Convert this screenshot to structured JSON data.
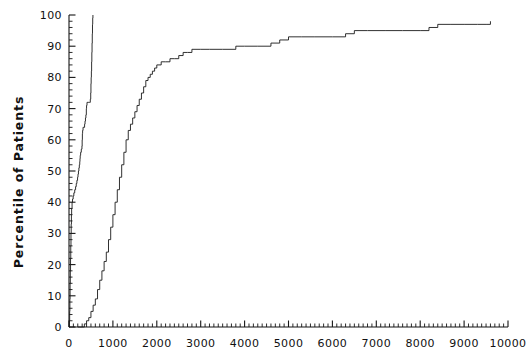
{
  "chart_data": {
    "type": "line",
    "title": "",
    "subtitle": "",
    "xlabel": "",
    "ylabel": "Percentile of Patients",
    "xlim": [
      0,
      10000
    ],
    "ylim": [
      0,
      100
    ],
    "grid": false,
    "legend": false,
    "legend_position": "none",
    "x_ticks": [
      0,
      1000,
      2000,
      3000,
      4000,
      5000,
      6000,
      7000,
      8000,
      9000,
      10000
    ],
    "x_tick_labels": [
      "0",
      "1000",
      "2000",
      "3000",
      "4000",
      "5000",
      "6000",
      "7000",
      "8000",
      "9000",
      "10000"
    ],
    "x_minor_tick_interval": 100,
    "y_ticks": [
      0,
      10,
      20,
      30,
      40,
      50,
      60,
      70,
      80,
      90,
      100
    ],
    "y_tick_labels": [
      "0",
      "10",
      "20",
      "30",
      "40",
      "50",
      "60",
      "70",
      "80",
      "90",
      "100"
    ],
    "y_minor_tick_interval": 2,
    "line_color": "#1a1a1a",
    "line_width": 0.9,
    "series": [
      {
        "name": "steep-cumulative-curve",
        "style": "step",
        "points": [
          [
            0,
            0
          ],
          [
            10,
            2
          ],
          [
            15,
            5
          ],
          [
            20,
            9
          ],
          [
            25,
            14
          ],
          [
            30,
            18
          ],
          [
            35,
            22
          ],
          [
            40,
            26
          ],
          [
            45,
            30
          ],
          [
            50,
            33
          ],
          [
            55,
            36
          ],
          [
            60,
            38
          ],
          [
            70,
            40
          ],
          [
            80,
            41
          ],
          [
            95,
            42
          ],
          [
            110,
            43
          ],
          [
            130,
            44
          ],
          [
            150,
            45
          ],
          [
            165,
            46
          ],
          [
            180,
            47
          ],
          [
            195,
            48
          ],
          [
            205,
            49
          ],
          [
            215,
            50
          ],
          [
            225,
            51
          ],
          [
            235,
            52
          ],
          [
            245,
            53
          ],
          [
            250,
            54
          ],
          [
            255,
            55
          ],
          [
            265,
            56
          ],
          [
            280,
            57
          ],
          [
            295,
            58
          ],
          [
            300,
            60
          ],
          [
            305,
            62
          ],
          [
            310,
            63
          ],
          [
            320,
            64
          ],
          [
            340,
            64
          ],
          [
            355,
            65
          ],
          [
            365,
            66
          ],
          [
            375,
            67
          ],
          [
            385,
            68
          ],
          [
            395,
            70
          ],
          [
            400,
            71
          ],
          [
            410,
            72
          ],
          [
            430,
            72
          ],
          [
            450,
            72
          ],
          [
            470,
            72
          ],
          [
            485,
            73
          ],
          [
            495,
            75
          ],
          [
            500,
            78
          ],
          [
            505,
            80
          ],
          [
            510,
            82
          ],
          [
            515,
            85
          ],
          [
            520,
            88
          ],
          [
            525,
            91
          ],
          [
            530,
            94
          ],
          [
            535,
            97
          ],
          [
            540,
            99
          ],
          [
            545,
            100
          ]
        ]
      },
      {
        "name": "broad-cumulative-curve",
        "style": "step",
        "points": [
          [
            200,
            0
          ],
          [
            300,
            0
          ],
          [
            350,
            1
          ],
          [
            400,
            2
          ],
          [
            450,
            3
          ],
          [
            500,
            5
          ],
          [
            550,
            7
          ],
          [
            600,
            9
          ],
          [
            650,
            12
          ],
          [
            700,
            15
          ],
          [
            750,
            18
          ],
          [
            800,
            21
          ],
          [
            850,
            24
          ],
          [
            900,
            28
          ],
          [
            950,
            32
          ],
          [
            1000,
            36
          ],
          [
            1050,
            40
          ],
          [
            1100,
            44
          ],
          [
            1150,
            48
          ],
          [
            1200,
            52
          ],
          [
            1250,
            56
          ],
          [
            1300,
            60
          ],
          [
            1350,
            63
          ],
          [
            1400,
            65
          ],
          [
            1450,
            67
          ],
          [
            1500,
            69
          ],
          [
            1550,
            71
          ],
          [
            1600,
            73
          ],
          [
            1650,
            75
          ],
          [
            1700,
            77
          ],
          [
            1750,
            79
          ],
          [
            1800,
            80
          ],
          [
            1850,
            81
          ],
          [
            1900,
            82
          ],
          [
            1950,
            83
          ],
          [
            2000,
            84
          ],
          [
            2100,
            85
          ],
          [
            2200,
            85
          ],
          [
            2300,
            86
          ],
          [
            2400,
            86
          ],
          [
            2500,
            87
          ],
          [
            2600,
            88
          ],
          [
            2700,
            88
          ],
          [
            2800,
            89
          ],
          [
            3000,
            89
          ],
          [
            3200,
            89
          ],
          [
            3500,
            89
          ],
          [
            3800,
            90
          ],
          [
            4000,
            90
          ],
          [
            4300,
            90
          ],
          [
            4600,
            91
          ],
          [
            4800,
            92
          ],
          [
            5000,
            93
          ],
          [
            5300,
            93
          ],
          [
            5600,
            93
          ],
          [
            6000,
            93
          ],
          [
            6300,
            94
          ],
          [
            6500,
            95
          ],
          [
            6800,
            95
          ],
          [
            7200,
            95
          ],
          [
            7600,
            95
          ],
          [
            8000,
            95
          ],
          [
            8200,
            96
          ],
          [
            8400,
            97
          ],
          [
            8700,
            97
          ],
          [
            9000,
            97
          ],
          [
            9300,
            97
          ],
          [
            9500,
            97
          ],
          [
            9600,
            98
          ]
        ]
      }
    ]
  },
  "axes": {
    "y_axis_name": "percentile-axis",
    "x_axis_name": "duration-axis"
  }
}
